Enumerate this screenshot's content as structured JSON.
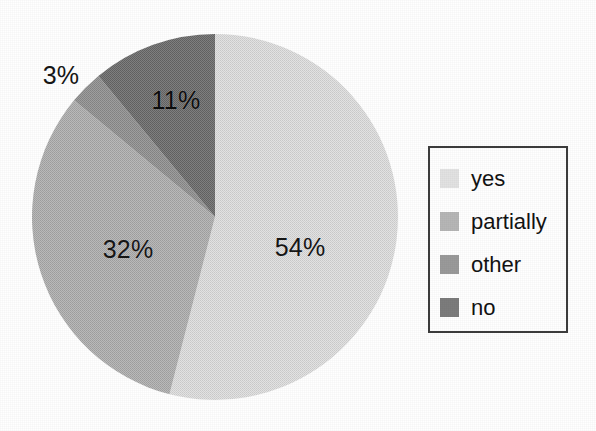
{
  "chart_data": {
    "type": "pie",
    "title": "",
    "subtitle": "",
    "xlabel": "",
    "ylabel": "",
    "categories": [
      "yes",
      "partially",
      "other",
      "no"
    ],
    "values": [
      54,
      32,
      3,
      11
    ],
    "value_unit": "%",
    "data_labels": [
      "54%",
      "32%",
      "3%",
      "11%"
    ],
    "colors": [
      "#dcdcdc",
      "#b0b0b0",
      "#959595",
      "#777777"
    ],
    "start_angle_deg": 0,
    "direction": "clockwise",
    "legend": {
      "position": "right",
      "entries": [
        {
          "label": "yes",
          "color": "#dcdcdc",
          "value": 54
        },
        {
          "label": "partially",
          "color": "#b0b0b0",
          "value": 32
        },
        {
          "label": "other",
          "color": "#959595",
          "value": 3
        },
        {
          "label": "no",
          "color": "#777777",
          "value": 11
        }
      ]
    },
    "grid": false,
    "annotations": []
  },
  "labels": {
    "yes_pct": "54%",
    "partially_pct": "32%",
    "other_pct": "3%",
    "no_pct": "11%"
  },
  "legend": {
    "items": [
      {
        "label": "yes"
      },
      {
        "label": "partially"
      },
      {
        "label": "other"
      },
      {
        "label": "no"
      }
    ]
  }
}
